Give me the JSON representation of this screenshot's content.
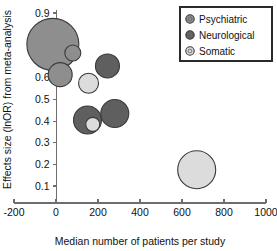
{
  "chart_data": {
    "type": "scatter",
    "title": "",
    "xlabel": "Median number of patients per study",
    "ylabel": "Effects size (lnOR) from meta-analysis",
    "xlim": [
      -200,
      1000
    ],
    "ylim": [
      0.05,
      0.93
    ],
    "grid": false,
    "xticks": [
      "-200",
      "0",
      "200",
      "400",
      "600",
      "800",
      "1000"
    ],
    "xtick_values": [
      -200,
      0,
      200,
      400,
      600,
      800,
      1000
    ],
    "yticks": [
      "0.9",
      "0.8",
      "0.7",
      "0.6",
      "0.5",
      "0.4",
      "0.3",
      "0.2",
      "0.1"
    ],
    "ytick_values": [
      0.9,
      0.8,
      0.7,
      0.6,
      0.5,
      0.4,
      0.3,
      0.2,
      0.1
    ],
    "legend_position": "top-right",
    "legend": [
      {
        "name": "Psychiatric",
        "color": "#8e8e8e"
      },
      {
        "name": "Neurological",
        "color": "#5f5f5f"
      },
      {
        "name": "Somatic",
        "color": "#dcdcdc"
      }
    ],
    "series": [
      {
        "name": "Psychiatric",
        "color": "#8e8e8e",
        "points": [
          {
            "x": -15,
            "y": 0.755,
            "size": 26
          },
          {
            "x": 80,
            "y": 0.715,
            "size": 8
          },
          {
            "x": 20,
            "y": 0.615,
            "size": 12
          }
        ]
      },
      {
        "name": "Neurological",
        "color": "#5f5f5f",
        "points": [
          {
            "x": 245,
            "y": 0.655,
            "size": 12
          },
          {
            "x": 150,
            "y": 0.405,
            "size": 14
          },
          {
            "x": 280,
            "y": 0.435,
            "size": 14
          }
        ]
      },
      {
        "name": "Somatic",
        "color": "#dcdcdc",
        "points": [
          {
            "x": 155,
            "y": 0.575,
            "size": 10
          },
          {
            "x": 175,
            "y": 0.385,
            "size": 7
          },
          {
            "x": 670,
            "y": 0.175,
            "size": 19
          }
        ]
      }
    ]
  }
}
